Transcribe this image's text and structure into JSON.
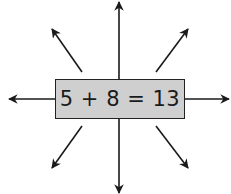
{
  "diagram": {
    "equation": "5 + 8 = 13",
    "box_fill": "#cfcfcf",
    "stroke_color": "#1a1a1a",
    "arrows": [
      {
        "name": "up",
        "x1": 119,
        "y1": 79,
        "x2": 119,
        "y2": 2
      },
      {
        "name": "down",
        "x1": 119,
        "y1": 119,
        "x2": 119,
        "y2": 193
      },
      {
        "name": "left",
        "x1": 55,
        "y1": 99,
        "x2": 9,
        "y2": 99
      },
      {
        "name": "right",
        "x1": 184,
        "y1": 99,
        "x2": 229,
        "y2": 99
      },
      {
        "name": "up-left",
        "x1": 82,
        "y1": 72,
        "x2": 52,
        "y2": 29
      },
      {
        "name": "up-right",
        "x1": 156,
        "y1": 72,
        "x2": 188,
        "y2": 29
      },
      {
        "name": "down-left",
        "x1": 82,
        "y1": 126,
        "x2": 52,
        "y2": 168
      },
      {
        "name": "down-right",
        "x1": 156,
        "y1": 126,
        "x2": 188,
        "y2": 168
      }
    ]
  }
}
